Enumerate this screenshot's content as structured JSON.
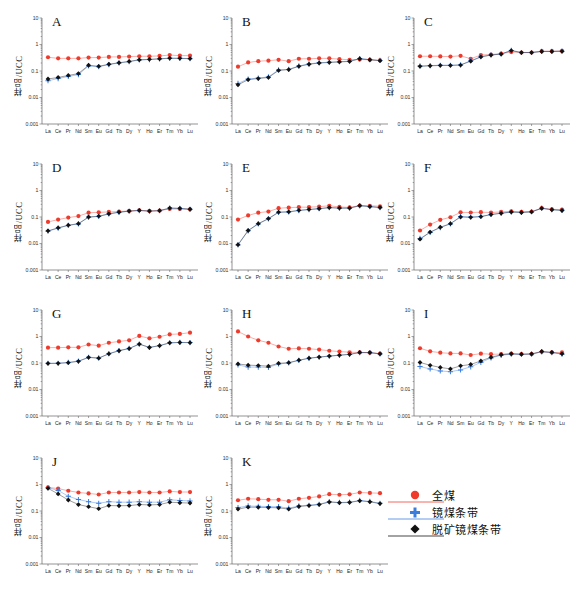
{
  "figure": {
    "ylabel": "样品/UCC",
    "y_ticks": [
      "10",
      "1",
      "0.1",
      "0.01",
      "0.001"
    ],
    "y_limits": [
      0.001,
      10
    ],
    "x_categories": [
      "La",
      "Ce",
      "Pr",
      "Nd",
      "Sm",
      "Eu",
      "Gd",
      "Tb",
      "Dy",
      "Y",
      "Ho",
      "Er",
      "Tm",
      "Yb",
      "Lu"
    ],
    "colors": {
      "series_full_coal": "#ef3b2c",
      "series_vitrain": "#3b7ddd",
      "series_demineralized": "#111111",
      "axis": "#666666"
    }
  },
  "legend": {
    "items": [
      {
        "label": "全煤",
        "marker": "circle",
        "color": "#ef3b2c",
        "name": "legend-item-full-coal"
      },
      {
        "label": "镜煤条带",
        "marker": "cross",
        "color": "#3b7ddd",
        "name": "legend-item-vitrain-band"
      },
      {
        "label": "脱矿镜煤条带",
        "marker": "diamond",
        "color": "#111111",
        "name": "legend-item-demineralized-vitrain-band"
      }
    ]
  },
  "chart_data": [
    {
      "type": "line",
      "title": "A",
      "xlabel": "",
      "ylabel": "样品/UCC",
      "ylim": [
        0.001,
        10
      ],
      "grid": false,
      "legend_position": "figure-bottom-right",
      "categories": [
        "La",
        "Ce",
        "Pr",
        "Nd",
        "Sm",
        "Eu",
        "Gd",
        "Tb",
        "Dy",
        "Y",
        "Ho",
        "Er",
        "Tm",
        "Yb",
        "Lu"
      ],
      "series": [
        {
          "name": "全煤",
          "values": [
            0.33,
            0.3,
            0.3,
            0.3,
            0.32,
            0.32,
            0.34,
            0.34,
            0.35,
            0.36,
            0.36,
            0.37,
            0.4,
            0.38,
            0.38
          ]
        },
        {
          "name": "镜煤条带",
          "values": [
            0.043,
            0.052,
            0.062,
            0.073,
            0.155,
            0.145,
            0.175,
            0.2,
            0.225,
            0.26,
            0.27,
            0.285,
            0.3,
            0.3,
            0.29
          ]
        },
        {
          "name": "脱矿镜煤条带",
          "values": [
            0.05,
            0.057,
            0.068,
            0.08,
            0.165,
            0.15,
            0.18,
            0.205,
            0.23,
            0.265,
            0.275,
            0.29,
            0.305,
            0.3,
            0.295
          ]
        }
      ]
    },
    {
      "type": "line",
      "title": "B",
      "xlabel": "",
      "ylabel": "样品/UCC",
      "ylim": [
        0.001,
        10
      ],
      "grid": false,
      "categories": [
        "La",
        "Ce",
        "Pr",
        "Nd",
        "Sm",
        "Eu",
        "Gd",
        "Tb",
        "Dy",
        "Y",
        "Ho",
        "Er",
        "Tm",
        "Yb",
        "Lu"
      ],
      "series": [
        {
          "name": "全煤",
          "values": [
            0.145,
            0.21,
            0.235,
            0.245,
            0.265,
            0.235,
            0.29,
            0.29,
            0.3,
            0.3,
            0.28,
            0.265,
            0.27,
            0.265,
            0.25
          ]
        },
        {
          "name": "镜煤条带",
          "values": [
            0.034,
            0.05,
            0.054,
            0.06,
            0.11,
            0.115,
            0.155,
            0.185,
            0.205,
            0.215,
            0.225,
            0.235,
            0.295,
            0.27,
            0.25
          ]
        },
        {
          "name": "脱矿镜煤条带",
          "values": [
            0.03,
            0.047,
            0.052,
            0.057,
            0.105,
            0.113,
            0.15,
            0.18,
            0.2,
            0.21,
            0.22,
            0.23,
            0.29,
            0.265,
            0.245
          ]
        }
      ]
    },
    {
      "type": "line",
      "title": "C",
      "xlabel": "",
      "ylabel": "样品/UCC",
      "ylim": [
        0.001,
        10
      ],
      "grid": false,
      "categories": [
        "La",
        "Ce",
        "Pr",
        "Nd",
        "Sm",
        "Eu",
        "Gd",
        "Tb",
        "Dy",
        "Y",
        "Ho",
        "Er",
        "Tm",
        "Yb",
        "Lu"
      ],
      "series": [
        {
          "name": "全煤",
          "values": [
            0.36,
            0.36,
            0.355,
            0.35,
            0.375,
            0.29,
            0.4,
            0.42,
            0.45,
            0.52,
            0.5,
            0.5,
            0.56,
            0.56,
            0.57
          ]
        },
        {
          "name": "镜煤条带",
          "values": [
            0.155,
            0.16,
            0.165,
            0.165,
            0.17,
            0.245,
            0.345,
            0.405,
            0.44,
            0.6,
            0.5,
            0.5,
            0.55,
            0.55,
            0.56
          ]
        },
        {
          "name": "脱矿镜煤条带",
          "values": [
            0.15,
            0.157,
            0.162,
            0.162,
            0.168,
            0.235,
            0.34,
            0.4,
            0.435,
            0.59,
            0.495,
            0.495,
            0.545,
            0.545,
            0.555
          ]
        }
      ]
    },
    {
      "type": "line",
      "title": "D",
      "xlabel": "",
      "ylabel": "样品/UCC",
      "ylim": [
        0.001,
        10
      ],
      "grid": false,
      "categories": [
        "La",
        "Ce",
        "Pr",
        "Nd",
        "Sm",
        "Eu",
        "Gd",
        "Tb",
        "Dy",
        "Y",
        "Ho",
        "Er",
        "Tm",
        "Yb",
        "Lu"
      ],
      "series": [
        {
          "name": "全煤",
          "values": [
            0.065,
            0.08,
            0.095,
            0.108,
            0.145,
            0.15,
            0.155,
            0.16,
            0.17,
            0.18,
            0.17,
            0.175,
            0.2,
            0.2,
            0.195
          ]
        },
        {
          "name": "镜煤条带",
          "values": [
            0.029,
            0.038,
            0.048,
            0.055,
            0.098,
            0.105,
            0.13,
            0.15,
            0.165,
            0.175,
            0.165,
            0.172,
            0.215,
            0.21,
            0.195
          ]
        },
        {
          "name": "脱矿镜煤条带",
          "values": [
            0.03,
            0.039,
            0.049,
            0.056,
            0.1,
            0.107,
            0.132,
            0.152,
            0.167,
            0.177,
            0.167,
            0.174,
            0.218,
            0.212,
            0.197
          ]
        }
      ]
    },
    {
      "type": "line",
      "title": "E",
      "xlabel": "",
      "ylabel": "样品/UCC",
      "ylim": [
        0.001,
        10
      ],
      "grid": false,
      "categories": [
        "La",
        "Ce",
        "Pr",
        "Nd",
        "Sm",
        "Eu",
        "Gd",
        "Tb",
        "Dy",
        "Y",
        "Ho",
        "Er",
        "Tm",
        "Yb",
        "Lu"
      ],
      "series": [
        {
          "name": "全煤",
          "values": [
            0.08,
            0.115,
            0.145,
            0.16,
            0.215,
            0.225,
            0.235,
            0.235,
            0.245,
            0.265,
            0.24,
            0.23,
            0.27,
            0.265,
            0.255
          ]
        },
        {
          "name": "镜煤条带",
          "values": [
            0.0088,
            0.03,
            0.055,
            0.085,
            0.15,
            0.155,
            0.175,
            0.19,
            0.205,
            0.225,
            0.215,
            0.215,
            0.265,
            0.245,
            0.225
          ]
        },
        {
          "name": "脱矿镜煤条带",
          "values": [
            0.009,
            0.031,
            0.056,
            0.087,
            0.152,
            0.157,
            0.178,
            0.193,
            0.207,
            0.227,
            0.217,
            0.217,
            0.268,
            0.248,
            0.228
          ]
        }
      ]
    },
    {
      "type": "line",
      "title": "F",
      "xlabel": "",
      "ylabel": "样品/UCC",
      "ylim": [
        0.001,
        10
      ],
      "grid": false,
      "categories": [
        "La",
        "Ce",
        "Pr",
        "Nd",
        "Sm",
        "Eu",
        "Gd",
        "Tb",
        "Dy",
        "Y",
        "Ho",
        "Er",
        "Tm",
        "Yb",
        "Lu"
      ],
      "series": [
        {
          "name": "全煤",
          "values": [
            0.031,
            0.052,
            0.078,
            0.098,
            0.15,
            0.148,
            0.152,
            0.148,
            0.155,
            0.165,
            0.155,
            0.16,
            0.215,
            0.195,
            0.19
          ]
        },
        {
          "name": "镜煤条带",
          "values": [
            0.0155,
            0.026,
            0.04,
            0.055,
            0.105,
            0.1,
            0.105,
            0.125,
            0.14,
            0.155,
            0.15,
            0.158,
            0.215,
            0.19,
            0.178
          ]
        },
        {
          "name": "脱矿镜煤条带",
          "values": [
            0.0145,
            0.027,
            0.041,
            0.056,
            0.1,
            0.097,
            0.103,
            0.123,
            0.138,
            0.153,
            0.148,
            0.156,
            0.212,
            0.188,
            0.176
          ]
        }
      ]
    },
    {
      "type": "line",
      "title": "G",
      "xlabel": "",
      "ylabel": "样品/UCC",
      "ylim": [
        0.001,
        10
      ],
      "grid": false,
      "categories": [
        "La",
        "Ce",
        "Pr",
        "Nd",
        "Sm",
        "Eu",
        "Gd",
        "Tb",
        "Dy",
        "Y",
        "Ho",
        "Er",
        "Tm",
        "Yb",
        "Lu"
      ],
      "series": [
        {
          "name": "全煤",
          "values": [
            0.38,
            0.38,
            0.39,
            0.39,
            0.5,
            0.45,
            0.58,
            0.65,
            0.72,
            1.05,
            0.85,
            0.98,
            1.2,
            1.25,
            1.4
          ]
        },
        {
          "name": "镜煤条带",
          "values": [
            0.098,
            0.098,
            0.105,
            0.118,
            0.165,
            0.155,
            0.225,
            0.295,
            0.355,
            0.52,
            0.39,
            0.455,
            0.58,
            0.6,
            0.59
          ]
        },
        {
          "name": "脱矿镜煤条带",
          "values": [
            0.096,
            0.097,
            0.103,
            0.116,
            0.162,
            0.152,
            0.222,
            0.29,
            0.35,
            0.515,
            0.385,
            0.45,
            0.575,
            0.595,
            0.585
          ]
        }
      ]
    },
    {
      "type": "line",
      "title": "H",
      "xlabel": "",
      "ylabel": "样品/UCC",
      "ylim": [
        0.001,
        10
      ],
      "grid": false,
      "categories": [
        "La",
        "Ce",
        "Pr",
        "Nd",
        "Sm",
        "Eu",
        "Gd",
        "Tb",
        "Dy",
        "Y",
        "Ho",
        "Er",
        "Tm",
        "Yb",
        "Lu"
      ],
      "series": [
        {
          "name": "全煤",
          "values": [
            1.55,
            1.0,
            0.72,
            0.58,
            0.42,
            0.345,
            0.355,
            0.345,
            0.32,
            0.29,
            0.27,
            0.255,
            0.25,
            0.245,
            0.225
          ]
        },
        {
          "name": "镜煤条带",
          "values": [
            0.085,
            0.07,
            0.07,
            0.068,
            0.092,
            0.1,
            0.125,
            0.15,
            0.165,
            0.18,
            0.195,
            0.21,
            0.245,
            0.245,
            0.22
          ]
        },
        {
          "name": "脱矿镜煤条带",
          "values": [
            0.092,
            0.083,
            0.08,
            0.076,
            0.097,
            0.103,
            0.128,
            0.152,
            0.168,
            0.183,
            0.198,
            0.213,
            0.25,
            0.248,
            0.222
          ]
        }
      ]
    },
    {
      "type": "line",
      "title": "I",
      "xlabel": "",
      "ylabel": "样品/UCC",
      "ylim": [
        0.001,
        10
      ],
      "grid": false,
      "categories": [
        "La",
        "Ce",
        "Pr",
        "Nd",
        "Sm",
        "Eu",
        "Gd",
        "Tb",
        "Dy",
        "Y",
        "Ho",
        "Er",
        "Tm",
        "Yb",
        "Lu"
      ],
      "series": [
        {
          "name": "全煤",
          "values": [
            0.36,
            0.275,
            0.245,
            0.23,
            0.23,
            0.2,
            0.225,
            0.215,
            0.215,
            0.225,
            0.215,
            0.215,
            0.265,
            0.25,
            0.25
          ]
        },
        {
          "name": "镜煤条带",
          "values": [
            0.073,
            0.06,
            0.05,
            0.047,
            0.055,
            0.072,
            0.105,
            0.155,
            0.195,
            0.215,
            0.21,
            0.215,
            0.265,
            0.245,
            0.215
          ]
        },
        {
          "name": "脱矿镜煤条带",
          "values": [
            0.105,
            0.082,
            0.068,
            0.06,
            0.078,
            0.088,
            0.12,
            0.165,
            0.205,
            0.222,
            0.215,
            0.222,
            0.272,
            0.252,
            0.222
          ]
        }
      ]
    },
    {
      "type": "line",
      "title": "J",
      "xlabel": "",
      "ylabel": "样品/UCC",
      "ylim": [
        0.001,
        10
      ],
      "grid": false,
      "categories": [
        "La",
        "Ce",
        "Pr",
        "Nd",
        "Sm",
        "Eu",
        "Gd",
        "Tb",
        "Dy",
        "Y",
        "Ho",
        "Er",
        "Tm",
        "Yb",
        "Lu"
      ],
      "series": [
        {
          "name": "全煤",
          "values": [
            0.78,
            0.7,
            0.58,
            0.5,
            0.46,
            0.42,
            0.5,
            0.5,
            0.5,
            0.52,
            0.5,
            0.5,
            0.55,
            0.52,
            0.52
          ]
        },
        {
          "name": "镜煤条带",
          "values": [
            0.76,
            0.6,
            0.36,
            0.27,
            0.225,
            0.195,
            0.225,
            0.215,
            0.215,
            0.225,
            0.215,
            0.215,
            0.265,
            0.25,
            0.24
          ]
        },
        {
          "name": "脱矿镜煤条带",
          "values": [
            0.72,
            0.44,
            0.26,
            0.175,
            0.145,
            0.122,
            0.16,
            0.158,
            0.16,
            0.175,
            0.17,
            0.175,
            0.215,
            0.205,
            0.2
          ]
        }
      ]
    },
    {
      "type": "line",
      "title": "K",
      "xlabel": "",
      "ylabel": "样品/UCC",
      "ylim": [
        0.001,
        10
      ],
      "grid": false,
      "categories": [
        "La",
        "Ce",
        "Pr",
        "Nd",
        "Sm",
        "Eu",
        "Gd",
        "Tb",
        "Dy",
        "Y",
        "Ho",
        "Er",
        "Tm",
        "Yb",
        "Lu"
      ],
      "series": [
        {
          "name": "全煤",
          "values": [
            0.255,
            0.29,
            0.28,
            0.265,
            0.265,
            0.235,
            0.29,
            0.315,
            0.355,
            0.43,
            0.41,
            0.425,
            0.5,
            0.48,
            0.47
          ]
        },
        {
          "name": "镜煤条带",
          "values": [
            0.135,
            0.155,
            0.15,
            0.148,
            0.145,
            0.128,
            0.155,
            0.165,
            0.18,
            0.225,
            0.21,
            0.215,
            0.25,
            0.23,
            0.195
          ]
        },
        {
          "name": "脱矿镜煤条带",
          "values": [
            0.118,
            0.14,
            0.138,
            0.135,
            0.132,
            0.118,
            0.148,
            0.16,
            0.175,
            0.218,
            0.205,
            0.21,
            0.243,
            0.222,
            0.19
          ]
        }
      ]
    }
  ]
}
